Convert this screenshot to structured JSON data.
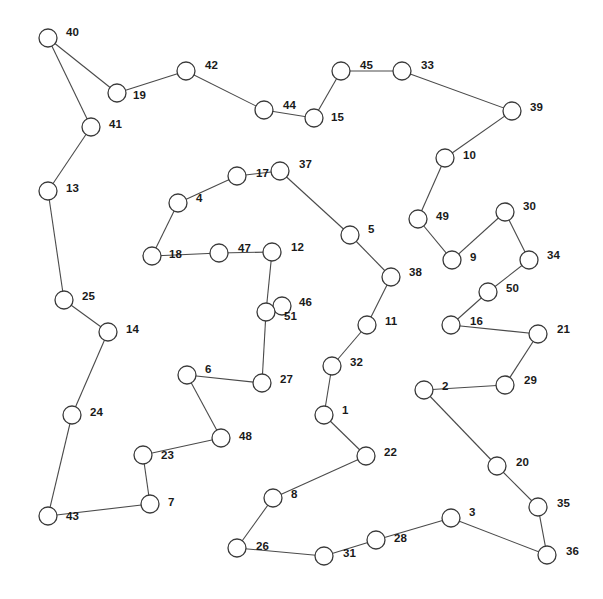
{
  "figure": {
    "type": "node-link-graph",
    "width": 603,
    "height": 599,
    "background_color": "#ffffff",
    "node_fill_color": "#ffffff",
    "node_stroke_color": "#3a3a3a",
    "edge_color": "#4a4a4a",
    "label_color": "#1a1a1a",
    "node_radius": 9,
    "node_count": 51,
    "edge_count": 50
  },
  "chart_data": {
    "type": "scatter",
    "title": "",
    "xlabel": "",
    "ylabel": "",
    "nodes": [
      {
        "id": 40,
        "label": "40",
        "x": 48,
        "y": 38,
        "lx": 66,
        "ly": 33
      },
      {
        "id": 19,
        "label": "19",
        "x": 117,
        "y": 93,
        "lx": 133,
        "ly": 96
      },
      {
        "id": 42,
        "label": "42",
        "x": 186,
        "y": 71,
        "lx": 205,
        "ly": 66
      },
      {
        "id": 44,
        "label": "44",
        "x": 264,
        "y": 110,
        "lx": 283,
        "ly": 106
      },
      {
        "id": 15,
        "label": "15",
        "x": 314,
        "y": 118,
        "lx": 331,
        "ly": 118
      },
      {
        "id": 45,
        "label": "45",
        "x": 341,
        "y": 71,
        "lx": 360,
        "ly": 66
      },
      {
        "id": 33,
        "label": "33",
        "x": 402,
        "y": 71,
        "lx": 421,
        "ly": 66
      },
      {
        "id": 39,
        "label": "39",
        "x": 512,
        "y": 111,
        "lx": 530,
        "ly": 108
      },
      {
        "id": 10,
        "label": "10",
        "x": 445,
        "y": 158,
        "lx": 463,
        "ly": 156
      },
      {
        "id": 41,
        "label": "41",
        "x": 91,
        "y": 127,
        "lx": 109,
        "ly": 125
      },
      {
        "id": 13,
        "label": "13",
        "x": 48,
        "y": 191,
        "lx": 66,
        "ly": 189
      },
      {
        "id": 37,
        "label": "37",
        "x": 280,
        "y": 171,
        "lx": 299,
        "ly": 165
      },
      {
        "id": 17,
        "label": "17",
        "x": 237,
        "y": 176,
        "lx": 256,
        "ly": 174
      },
      {
        "id": 4,
        "label": "4",
        "x": 178,
        "y": 203,
        "lx": 196,
        "ly": 199
      },
      {
        "id": 49,
        "label": "49",
        "x": 418,
        "y": 219,
        "lx": 436,
        "ly": 217
      },
      {
        "id": 30,
        "label": "30",
        "x": 505,
        "y": 212,
        "lx": 523,
        "ly": 207
      },
      {
        "id": 5,
        "label": "5",
        "x": 350,
        "y": 235,
        "lx": 368,
        "ly": 230
      },
      {
        "id": 18,
        "label": "18",
        "x": 152,
        "y": 256,
        "lx": 169,
        "ly": 255
      },
      {
        "id": 47,
        "label": "47",
        "x": 219,
        "y": 253,
        "lx": 238,
        "ly": 249
      },
      {
        "id": 12,
        "label": "12",
        "x": 272,
        "y": 252,
        "lx": 291,
        "ly": 248
      },
      {
        "id": 9,
        "label": "9",
        "x": 452,
        "y": 260,
        "lx": 470,
        "ly": 258
      },
      {
        "id": 34,
        "label": "34",
        "x": 529,
        "y": 260,
        "lx": 547,
        "ly": 256
      },
      {
        "id": 38,
        "label": "38",
        "x": 391,
        "y": 277,
        "lx": 409,
        "ly": 273
      },
      {
        "id": 50,
        "label": "50",
        "x": 488,
        "y": 292,
        "lx": 506,
        "ly": 289
      },
      {
        "id": 25,
        "label": "25",
        "x": 64,
        "y": 300,
        "lx": 82,
        "ly": 297
      },
      {
        "id": 46,
        "label": "46",
        "x": 282,
        "y": 306,
        "lx": 299,
        "ly": 303
      },
      {
        "id": 51,
        "label": "51",
        "x": 266,
        "y": 312,
        "lx": 284,
        "ly": 317
      },
      {
        "id": 11,
        "label": "11",
        "x": 367,
        "y": 325,
        "lx": 385,
        "ly": 322
      },
      {
        "id": 16,
        "label": "16",
        "x": 451,
        "y": 325,
        "lx": 470,
        "ly": 322
      },
      {
        "id": 21,
        "label": "21",
        "x": 538,
        "y": 334,
        "lx": 557,
        "ly": 330
      },
      {
        "id": 14,
        "label": "14",
        "x": 108,
        "y": 332,
        "lx": 126,
        "ly": 330
      },
      {
        "id": 32,
        "label": "32",
        "x": 332,
        "y": 366,
        "lx": 350,
        "ly": 363
      },
      {
        "id": 6,
        "label": "6",
        "x": 187,
        "y": 375,
        "lx": 205,
        "ly": 370
      },
      {
        "id": 27,
        "label": "27",
        "x": 262,
        "y": 383,
        "lx": 280,
        "ly": 380
      },
      {
        "id": 29,
        "label": "29",
        "x": 505,
        "y": 385,
        "lx": 524,
        "ly": 381
      },
      {
        "id": 2,
        "label": "2",
        "x": 424,
        "y": 390,
        "lx": 442,
        "ly": 387
      },
      {
        "id": 24,
        "label": "24",
        "x": 72,
        "y": 415,
        "lx": 90,
        "ly": 413
      },
      {
        "id": 1,
        "label": "1",
        "x": 324,
        "y": 415,
        "lx": 342,
        "ly": 411
      },
      {
        "id": 48,
        "label": "48",
        "x": 221,
        "y": 438,
        "lx": 239,
        "ly": 437
      },
      {
        "id": 23,
        "label": "23",
        "x": 143,
        "y": 455,
        "lx": 161,
        "ly": 456
      },
      {
        "id": 22,
        "label": "22",
        "x": 366,
        "y": 456,
        "lx": 384,
        "ly": 453
      },
      {
        "id": 20,
        "label": "20",
        "x": 497,
        "y": 466,
        "lx": 516,
        "ly": 463
      },
      {
        "id": 8,
        "label": "8",
        "x": 273,
        "y": 498,
        "lx": 291,
        "ly": 495
      },
      {
        "id": 7,
        "label": "7",
        "x": 150,
        "y": 504,
        "lx": 168,
        "ly": 503
      },
      {
        "id": 35,
        "label": "35",
        "x": 538,
        "y": 507,
        "lx": 557,
        "ly": 504
      },
      {
        "id": 3,
        "label": "3",
        "x": 451,
        "y": 518,
        "lx": 469,
        "ly": 513
      },
      {
        "id": 43,
        "label": "43",
        "x": 48,
        "y": 516,
        "lx": 66,
        "ly": 517
      },
      {
        "id": 28,
        "label": "28",
        "x": 376,
        "y": 540,
        "lx": 394,
        "ly": 539
      },
      {
        "id": 26,
        "label": "26",
        "x": 237,
        "y": 548,
        "lx": 256,
        "ly": 547
      },
      {
        "id": 31,
        "label": "31",
        "x": 324,
        "y": 556,
        "lx": 343,
        "ly": 554
      },
      {
        "id": 36,
        "label": "36",
        "x": 547,
        "y": 555,
        "lx": 566,
        "ly": 552
      }
    ],
    "edges": [
      [
        40,
        19
      ],
      [
        40,
        41
      ],
      [
        19,
        42
      ],
      [
        42,
        44
      ],
      [
        44,
        15
      ],
      [
        15,
        45
      ],
      [
        45,
        33
      ],
      [
        33,
        39
      ],
      [
        39,
        10
      ],
      [
        10,
        49
      ],
      [
        49,
        9
      ],
      [
        9,
        30
      ],
      [
        30,
        34
      ],
      [
        34,
        50
      ],
      [
        50,
        16
      ],
      [
        16,
        21
      ],
      [
        21,
        29
      ],
      [
        29,
        2
      ],
      [
        2,
        20
      ],
      [
        20,
        35
      ],
      [
        35,
        36
      ],
      [
        36,
        3
      ],
      [
        3,
        28
      ],
      [
        28,
        31
      ],
      [
        31,
        26
      ],
      [
        26,
        8
      ],
      [
        8,
        22
      ],
      [
        22,
        1
      ],
      [
        1,
        32
      ],
      [
        32,
        11
      ],
      [
        11,
        38
      ],
      [
        38,
        5
      ],
      [
        5,
        37
      ],
      [
        37,
        17
      ],
      [
        17,
        4
      ],
      [
        4,
        18
      ],
      [
        18,
        47
      ],
      [
        47,
        12
      ],
      [
        12,
        51
      ],
      [
        51,
        46
      ],
      [
        51,
        27
      ],
      [
        27,
        6
      ],
      [
        6,
        48
      ],
      [
        48,
        23
      ],
      [
        23,
        7
      ],
      [
        7,
        43
      ],
      [
        43,
        24
      ],
      [
        24,
        14
      ],
      [
        14,
        25
      ],
      [
        25,
        13
      ],
      [
        13,
        41
      ]
    ]
  }
}
